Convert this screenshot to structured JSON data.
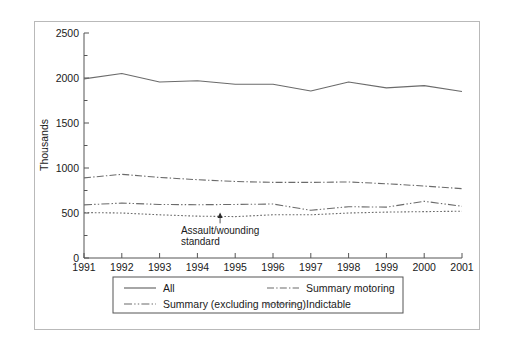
{
  "chart_data": {
    "type": "line",
    "title": "",
    "xlabel": "",
    "ylabel": "Thousands",
    "x": [
      1991,
      1992,
      1993,
      1994,
      1995,
      1996,
      1997,
      1998,
      1999,
      2000,
      2001
    ],
    "xtick_labels": [
      "1991",
      "1992",
      "1993",
      "1994",
      "1995",
      "1996",
      "1997",
      "1998",
      "1999",
      "2000",
      "2001"
    ],
    "ytick_labels": [
      "0",
      "500",
      "1000",
      "1500",
      "2000",
      "2500"
    ],
    "ytick_values": [
      0,
      500,
      1000,
      1500,
      2000,
      2500
    ],
    "yminor_values": [
      250,
      750,
      1250,
      1750,
      2250
    ],
    "ylim": [
      0,
      2500
    ],
    "xlim": [
      1991,
      2001
    ],
    "grid": false,
    "legend_position": "below-axis",
    "series": [
      {
        "name": "All",
        "style": "solid",
        "values": [
          1990,
          2050,
          1955,
          1970,
          1930,
          1930,
          1855,
          1955,
          1890,
          1915,
          1850
        ]
      },
      {
        "name": "Summary motoring",
        "style": "dash-dot",
        "values": [
          890,
          930,
          895,
          870,
          850,
          840,
          840,
          845,
          825,
          800,
          770
        ]
      },
      {
        "name": "Summary (excluding motoring)",
        "style": "dash-dot-dot",
        "values": [
          590,
          610,
          595,
          592,
          595,
          600,
          530,
          570,
          565,
          630,
          575
        ]
      },
      {
        "name": "Indictable",
        "style": "dotted",
        "values": [
          505,
          500,
          480,
          465,
          460,
          480,
          480,
          500,
          510,
          515,
          520
        ]
      }
    ],
    "annotations": [
      {
        "text_line1": "Assault/wounding",
        "text_line2": "standard",
        "arrow": "up-arrow",
        "x": 1994.6,
        "y": 440
      }
    ]
  },
  "legend": {
    "entries": [
      {
        "label": "All",
        "style": "solid"
      },
      {
        "label": "Summary motoring",
        "style": "dash-dot"
      },
      {
        "label": "Summary (excluding motoring)",
        "style": "dash-dot-dot"
      },
      {
        "label": "Indictable",
        "style": "dotted"
      }
    ]
  },
  "colors": {
    "line": "#6b6b6b",
    "axis": "#555555",
    "text": "#1a1a1a",
    "frame": "#b9b9b9",
    "background": "#ffffff"
  }
}
